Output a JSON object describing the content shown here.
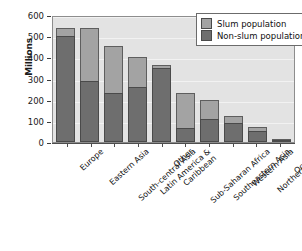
{
  "chart_data": {
    "type": "bar",
    "subtype": "stacked-vertical",
    "title": "",
    "xlabel": "",
    "ylabel": "Millions",
    "ylim": [
      0,
      600
    ],
    "yticks": [
      0,
      100,
      200,
      300,
      400,
      500,
      600
    ],
    "ytick_labels": [
      "0",
      "100",
      "200",
      "300",
      "400",
      "500",
      "600"
    ],
    "grid": true,
    "grid_axis": "y",
    "legend_position": "top-right",
    "categories": [
      "Europe",
      "Eastern Asia",
      "South-central Asia",
      "Latin America &\nCaribbean",
      "Other",
      "Sub-Saharan Africa",
      "Southeastern Asia",
      "Western Asia",
      "Northern Africa",
      "Oceania"
    ],
    "series": [
      {
        "name": "Non-slum population",
        "color": "#6e6e6e",
        "values": [
          500,
          290,
          233,
          262,
          350,
          65,
          110,
          90,
          52,
          7
        ]
      },
      {
        "name": "Slum population",
        "color": "#a3a3a3",
        "values": [
          40,
          250,
          220,
          138,
          12,
          166,
          90,
          35,
          21,
          1
        ]
      }
    ],
    "totals": [
      540,
      540,
      453,
      400,
      362,
      231,
      200,
      125,
      73,
      8
    ]
  },
  "legend": {
    "items": [
      {
        "label": "Slum population",
        "color": "#a3a3a3"
      },
      {
        "label": "Non-slum population",
        "color": "#6e6e6e"
      }
    ]
  },
  "axis": {
    "y_title": "Millions"
  },
  "category_labels": [
    {
      "lines": [
        "Europe"
      ]
    },
    {
      "lines": [
        "Eastern Asia"
      ]
    },
    {
      "lines": [
        "South-central Asia"
      ]
    },
    {
      "lines": [
        "Latin America &",
        "Caribbean"
      ]
    },
    {
      "lines": [
        "Other"
      ]
    },
    {
      "lines": [
        "Sub-Saharan Africa"
      ]
    },
    {
      "lines": [
        "Southeastern Asia"
      ]
    },
    {
      "lines": [
        "Western Asia"
      ]
    },
    {
      "lines": [
        "Northern Africa"
      ]
    },
    {
      "lines": [
        "Oceania"
      ]
    }
  ]
}
